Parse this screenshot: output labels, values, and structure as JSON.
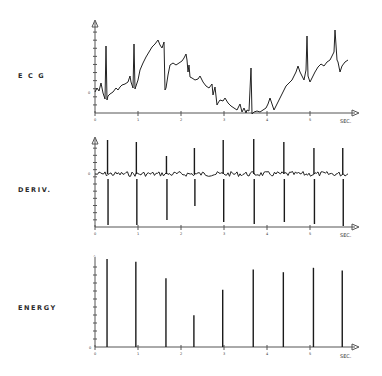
{
  "chart_data": [
    {
      "type": "line",
      "title": "ECG",
      "xlabel": "SEC.",
      "ylabel": "",
      "x_ticks": [
        "0",
        "1",
        "2",
        "3",
        "4",
        "5"
      ],
      "xlim": [
        0,
        5.8
      ],
      "y_origin_label": "0",
      "grid": false,
      "r_peak_times_sec": [
        0.25,
        0.92,
        1.62,
        3.62,
        4.35,
        5.05,
        5.72
      ],
      "description": "Raw ECG trace with baseline wander; sharp R-peaks roughly every 0.7 s; baseline rises to a maximum near 1.6 s, drifts down to a minimum near 3.7 s, then rises again toward the end."
    },
    {
      "type": "line",
      "title": "DERIV.",
      "xlabel": "SEC.",
      "ylabel": "",
      "x_ticks": [
        "0",
        "1",
        "2",
        "3",
        "4",
        "5"
      ],
      "xlim": [
        0,
        5.8
      ],
      "y_origin_label": "0",
      "grid": false,
      "spike_times_sec": [
        0.28,
        0.95,
        1.65,
        2.3,
        2.97,
        3.68,
        4.38,
        5.08,
        5.75
      ],
      "description": "Derivative of the ECG: noisy baseline around zero with bipolar spikes at each QRS complex."
    },
    {
      "type": "bar",
      "title": "ENERGY",
      "xlabel": "SEC.",
      "ylabel": "",
      "x_ticks": [
        "0",
        "1",
        "2",
        "3",
        "4",
        "5"
      ],
      "xlim": [
        0,
        5.8
      ],
      "ylim": [
        0,
        100
      ],
      "y_origin_label": "0",
      "grid": false,
      "x": [
        0.28,
        0.95,
        1.65,
        2.3,
        2.97,
        3.68,
        4.38,
        5.08,
        5.75
      ],
      "values": [
        100,
        97,
        78,
        36,
        65,
        88,
        85,
        90,
        87
      ],
      "description": "Energy signal: narrow spikes at each detected beat, relative amplitudes."
    }
  ],
  "labels": {
    "ecg": "E C G",
    "deriv": "DERIV.",
    "energy": "ENERGY",
    "sec": "SEC."
  }
}
